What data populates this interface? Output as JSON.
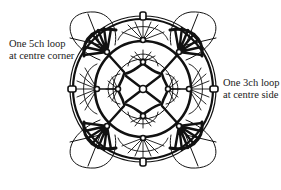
{
  "diagram": {
    "type": "crochet motif chart",
    "labels": {
      "corner": {
        "line1": "One 5ch loop",
        "line2": "at centre corner"
      },
      "side": {
        "line1": "One 3ch loop",
        "line2": "at centre side"
      }
    },
    "colors": {
      "ink": "#111111",
      "background": "#ffffff"
    }
  }
}
